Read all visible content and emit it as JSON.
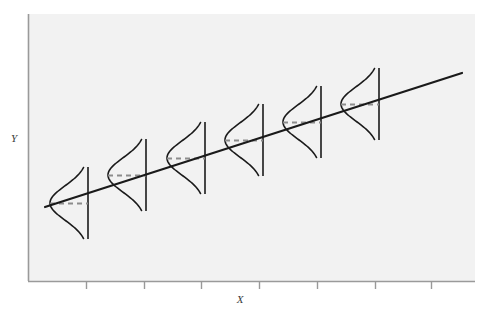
{
  "figure": {
    "title": "",
    "background_color": "#ffffff",
    "plot_background_color": "#f2f2f2",
    "width": 490,
    "height": 323
  },
  "axes": {
    "x_label": "X",
    "y_label": "Y",
    "x_tick_count": 7,
    "y_tick_count": 0,
    "axis_color": "#999999",
    "plot_left": 28,
    "plot_right": 475,
    "plot_top": 14,
    "plot_bottom": 281
  },
  "chart_data": {
    "type": "line",
    "title": "",
    "xlabel": "X",
    "ylabel": "Y",
    "grid": false,
    "legend": "none",
    "xlim": [
      0,
      7
    ],
    "ylim": [
      0,
      10
    ],
    "x_tick_positions_px": [
      86,
      144,
      201,
      259,
      317,
      375,
      431
    ],
    "series": [
      {
        "name": "regression-line",
        "type": "line",
        "style": "solid",
        "color": "#1a1a1a",
        "linewidth": 2.2,
        "x": [
          0.3,
          7.5
        ],
        "y": [
          2.86,
          8.63
        ],
        "px": [
          [
            45,
            207
          ],
          [
            462,
            73
          ]
        ],
        "description": "Population regression line of Y on X"
      },
      {
        "name": "conditional-distributions",
        "type": "normal-curves",
        "color": "#1a1a1a",
        "linewidth": 1.6,
        "orientation": "horizontal-bulge-left",
        "description": "Normal distribution of Y at each fixed value of X, drawn on the vertical ordinate line at that X",
        "points": [
          {
            "label": "x1",
            "x_px": 88,
            "mean_y_px": 203,
            "half_height_px": 36,
            "bulge_px": 38
          },
          {
            "label": "x2",
            "x_px": 146,
            "mean_y_px": 175,
            "half_height_px": 36,
            "bulge_px": 38
          },
          {
            "label": "x3",
            "x_px": 205,
            "mean_y_px": 158,
            "half_height_px": 36,
            "bulge_px": 38
          },
          {
            "label": "x4",
            "x_px": 263,
            "mean_y_px": 140,
            "half_height_px": 36,
            "bulge_px": 38
          },
          {
            "label": "x5",
            "x_px": 321,
            "mean_y_px": 122,
            "half_height_px": 36,
            "bulge_px": 38
          },
          {
            "label": "x6",
            "x_px": 379,
            "mean_y_px": 104,
            "half_height_px": 36,
            "bulge_px": 38
          }
        ]
      },
      {
        "name": "mean-indicator-lines",
        "type": "dashed-segments",
        "style": "dashed",
        "color": "#8c8c8c",
        "linewidth": 1.8,
        "description": "Dashed horizontal segment at the mean of each conditional distribution"
      }
    ]
  }
}
